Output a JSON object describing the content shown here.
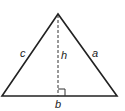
{
  "diagram": {
    "type": "triangle",
    "labels": {
      "side_left": "c",
      "side_right": "a",
      "base": "b",
      "height": "h"
    },
    "colors": {
      "stroke": "#222222",
      "background": "#ffffff"
    }
  }
}
